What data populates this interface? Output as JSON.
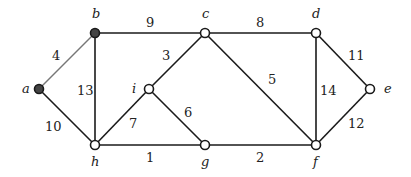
{
  "graph": {
    "nodes": [
      {
        "id": "a",
        "label": "a",
        "x": 39,
        "y": 89,
        "filled": true,
        "lx": 22,
        "ly": 93
      },
      {
        "id": "b",
        "label": "b",
        "x": 95,
        "y": 33,
        "filled": true,
        "lx": 92,
        "ly": 18
      },
      {
        "id": "c",
        "label": "c",
        "x": 205,
        "y": 33,
        "filled": false,
        "lx": 202,
        "ly": 18
      },
      {
        "id": "d",
        "label": "d",
        "x": 316,
        "y": 33,
        "filled": false,
        "lx": 312,
        "ly": 18
      },
      {
        "id": "e",
        "label": "e",
        "x": 370,
        "y": 89,
        "filled": false,
        "lx": 384,
        "ly": 93
      },
      {
        "id": "i",
        "label": "i",
        "x": 149,
        "y": 89,
        "filled": false,
        "lx": 132,
        "ly": 93
      },
      {
        "id": "h",
        "label": "h",
        "x": 95,
        "y": 145,
        "filled": false,
        "lx": 91,
        "ly": 166
      },
      {
        "id": "g",
        "label": "g",
        "x": 205,
        "y": 145,
        "filled": false,
        "lx": 201,
        "ly": 166
      },
      {
        "id": "f",
        "label": "f",
        "x": 316,
        "y": 145,
        "filled": false,
        "lx": 313,
        "ly": 166
      }
    ],
    "edges": [
      {
        "from": "a",
        "to": "b",
        "weight": "4",
        "highlight": true,
        "lx": 52,
        "ly": 60
      },
      {
        "from": "a",
        "to": "h",
        "weight": "10",
        "highlight": false,
        "lx": 45,
        "ly": 131
      },
      {
        "from": "b",
        "to": "c",
        "weight": "9",
        "highlight": false,
        "lx": 146,
        "ly": 27
      },
      {
        "from": "b",
        "to": "h",
        "weight": "13",
        "highlight": false,
        "lx": 77,
        "ly": 95
      },
      {
        "from": "c",
        "to": "d",
        "weight": "8",
        "highlight": false,
        "lx": 256,
        "ly": 27
      },
      {
        "from": "c",
        "to": "i",
        "weight": "3",
        "highlight": false,
        "lx": 162,
        "ly": 60
      },
      {
        "from": "c",
        "to": "f",
        "weight": "5",
        "highlight": false,
        "lx": 268,
        "ly": 84
      },
      {
        "from": "i",
        "to": "h",
        "weight": "7",
        "highlight": false,
        "lx": 129,
        "ly": 128
      },
      {
        "from": "i",
        "to": "g",
        "weight": "6",
        "highlight": false,
        "lx": 184,
        "ly": 117
      },
      {
        "from": "h",
        "to": "g",
        "weight": "1",
        "highlight": false,
        "lx": 146,
        "ly": 162
      },
      {
        "from": "g",
        "to": "f",
        "weight": "2",
        "highlight": false,
        "lx": 256,
        "ly": 162
      },
      {
        "from": "d",
        "to": "f",
        "weight": "14",
        "highlight": false,
        "lx": 320,
        "ly": 95
      },
      {
        "from": "d",
        "to": "e",
        "weight": "11",
        "highlight": false,
        "lx": 348,
        "ly": 60
      },
      {
        "from": "f",
        "to": "e",
        "weight": "12",
        "highlight": false,
        "lx": 348,
        "ly": 128
      }
    ]
  }
}
